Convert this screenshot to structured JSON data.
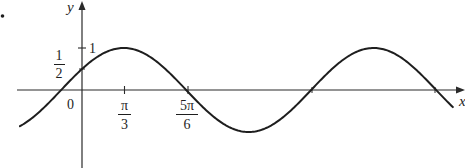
{
  "chart_data": {
    "type": "line",
    "title": "",
    "function": "y = sin(x + π/6)",
    "xlabel": "x",
    "ylabel": "y",
    "origin_label": "0",
    "x_ticks": [
      {
        "value": 1.0472,
        "label_num": "π",
        "label_den": "3"
      },
      {
        "value": 2.618,
        "label_num": "5π",
        "label_den": "6"
      }
    ],
    "y_ticks": [
      {
        "value": 1,
        "label": "1"
      },
      {
        "value": 0.5,
        "label_num": "1",
        "label_den": "2"
      }
    ],
    "x_intercepts": [
      -0.5236,
      2.618,
      5.7596,
      8.9012
    ],
    "maxima": [
      [
        1.0472,
        1
      ],
      [
        7.3304,
        1
      ]
    ],
    "minima": [
      [
        4.1888,
        -1
      ]
    ],
    "y_intercept": 0.5,
    "xlim": [
      -1.56,
      9.32
    ],
    "ylim": [
      -1.0,
      1.0
    ],
    "grid": false,
    "legend": null,
    "series": [
      {
        "name": "sin(x + π/6)",
        "x": [
          -1.56,
          -1.0472,
          -0.5236,
          0,
          0.5236,
          1.0472,
          1.5708,
          2.0944,
          2.618,
          3.1416,
          3.6652,
          4.1888,
          4.7124,
          5.236,
          5.7596,
          6.2832,
          6.8068,
          7.3304,
          7.854,
          8.3776,
          8.9012,
          9.32
        ],
        "values": [
          -0.85,
          -0.5,
          0,
          0.5,
          0.866,
          1,
          0.866,
          0.5,
          0,
          -0.5,
          -0.866,
          -1,
          -0.866,
          -0.5,
          0,
          0.5,
          0.866,
          1,
          0.866,
          0.5,
          0,
          -0.41
        ]
      }
    ],
    "colors": {
      "curve": "#1e1e1e",
      "axes": "#2a2a2a"
    }
  },
  "labels": {
    "bullet": "•",
    "y_axis": "y",
    "x_axis": "x",
    "origin": "0",
    "y_tick_one": "1",
    "y_tick_half_num": "1",
    "y_tick_half_den": "2",
    "x_tick_pi3_num": "π",
    "x_tick_pi3_den": "3",
    "x_tick_5pi6_num": "5π",
    "x_tick_5pi6_den": "6"
  }
}
